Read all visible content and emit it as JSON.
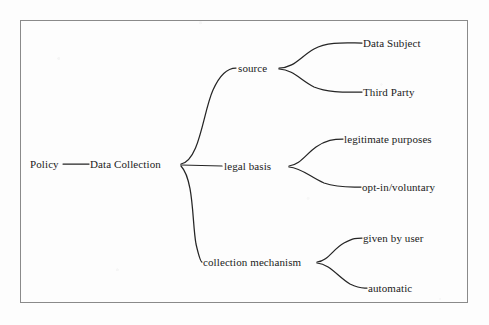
{
  "diagram": {
    "kind": "tree-mind-map",
    "frame": {
      "border_color": "#8a8a8a",
      "x": 20,
      "y": 20,
      "width": 448,
      "height": 283
    },
    "background_color": "#fdfdfd",
    "edge_color": "#252525",
    "text_color": "#1b1b1b",
    "nodes": {
      "root": {
        "label": "Policy",
        "x": 30,
        "y": 164
      },
      "level1": {
        "label": "Data Collection",
        "x": 90,
        "y": 164
      },
      "branch_source": {
        "label": "source",
        "x": 238,
        "y": 68
      },
      "branch_legal_basis": {
        "label": "legal basis",
        "x": 224,
        "y": 166
      },
      "branch_collection_mechanism": {
        "label": "collection mechanism",
        "x": 203,
        "y": 262
      },
      "leaf_data_subject": {
        "label": "Data Subject",
        "x": 363,
        "y": 43
      },
      "leaf_third_party": {
        "label": "Third Party",
        "x": 363,
        "y": 92
      },
      "leaf_legitimate_purposes": {
        "label": "legitimate purposes",
        "x": 344,
        "y": 139
      },
      "leaf_opt_in_voluntary": {
        "label": "opt-in/voluntary",
        "x": 362,
        "y": 187
      },
      "leaf_given_by_user": {
        "label": "given by user",
        "x": 363,
        "y": 238
      },
      "leaf_automatic": {
        "label": "automatic",
        "x": 368,
        "y": 288
      }
    },
    "edges": [
      {
        "name": "policy-to-data-collection",
        "from": "root",
        "to": "level1"
      },
      {
        "name": "data-collection-to-source",
        "from": "level1",
        "to": "branch_source"
      },
      {
        "name": "data-collection-to-legal-basis",
        "from": "level1",
        "to": "branch_legal_basis"
      },
      {
        "name": "data-collection-to-collection-mechanism",
        "from": "level1",
        "to": "branch_collection_mechanism"
      },
      {
        "name": "source-to-data-subject",
        "from": "branch_source",
        "to": "leaf_data_subject"
      },
      {
        "name": "source-to-third-party",
        "from": "branch_source",
        "to": "leaf_third_party"
      },
      {
        "name": "legal-basis-to-legitimate-purposes",
        "from": "branch_legal_basis",
        "to": "leaf_legitimate_purposes"
      },
      {
        "name": "legal-basis-to-opt-in-voluntary",
        "from": "branch_legal_basis",
        "to": "leaf_opt_in_voluntary"
      },
      {
        "name": "collection-mechanism-to-given-by-user",
        "from": "branch_collection_mechanism",
        "to": "leaf_given_by_user"
      },
      {
        "name": "collection-mechanism-to-automatic",
        "from": "branch_collection_mechanism",
        "to": "leaf_automatic"
      }
    ]
  }
}
